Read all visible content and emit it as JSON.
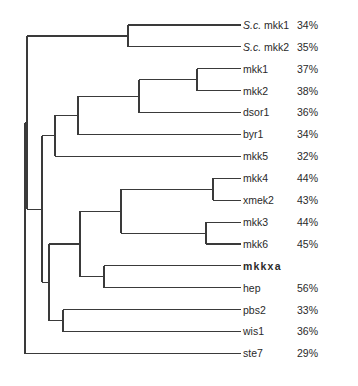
{
  "figure": {
    "type": "phylogenetic-tree",
    "leaves": [
      {
        "id": "scmkk1",
        "species_prefix": "S.c.",
        "name": "mkk1",
        "identity": "34%"
      },
      {
        "id": "scmkk2",
        "species_prefix": "S.c.",
        "name": "mkk2",
        "identity": "35%"
      },
      {
        "id": "mkk1",
        "species_prefix": "",
        "name": "mkk1",
        "identity": "37%"
      },
      {
        "id": "mkk2",
        "species_prefix": "",
        "name": "mkk2",
        "identity": "38%"
      },
      {
        "id": "dsor1",
        "species_prefix": "",
        "name": "dsor1",
        "identity": "36%"
      },
      {
        "id": "byr1",
        "species_prefix": "",
        "name": "byr1",
        "identity": "34%"
      },
      {
        "id": "mkk5",
        "species_prefix": "",
        "name": "mkk5",
        "identity": "32%"
      },
      {
        "id": "mkk4",
        "species_prefix": "",
        "name": "mkk4",
        "identity": "44%"
      },
      {
        "id": "xmek2",
        "species_prefix": "",
        "name": "xmek2",
        "identity": "43%"
      },
      {
        "id": "mkk3",
        "species_prefix": "",
        "name": "mkk3",
        "identity": "44%"
      },
      {
        "id": "mkk6",
        "species_prefix": "",
        "name": "mkk6",
        "identity": "45%"
      },
      {
        "id": "mkkxa",
        "species_prefix": "",
        "name": "mkkxa",
        "identity": "",
        "highlight": true
      },
      {
        "id": "hep",
        "species_prefix": "",
        "name": "hep",
        "identity": "56%"
      },
      {
        "id": "pbs2",
        "species_prefix": "",
        "name": "pbs2",
        "identity": "33%"
      },
      {
        "id": "wis1",
        "species_prefix": "",
        "name": "wis1",
        "identity": "36%"
      },
      {
        "id": "ste7",
        "species_prefix": "",
        "name": "ste7",
        "identity": "29%"
      }
    ],
    "topology": "(((((S.c. mkk1,S.c. mkk2),((((mkk1,mkk2),dsor1),byr1),mkk5),(((mkk4,xmek2),(mkk3,mkk6)),(mkkxa,hep)),(pbs2,wis1))),ste7)",
    "tree": {
      "children": [
        {
          "children": [
            {
              "children": [
                {
                  "leaf": "scmkk1"
                },
                {
                  "leaf": "scmkk2"
                }
              ]
            },
            {
              "children": [
                {
                  "children": [
                    {
                      "children": [
                        {
                          "children": [
                            {
                              "children": [
                                {
                                  "leaf": "mkk1"
                                },
                                {
                                  "leaf": "mkk2"
                                }
                              ]
                            },
                            {
                              "leaf": "dsor1"
                            }
                          ]
                        },
                        {
                          "leaf": "byr1"
                        }
                      ]
                    },
                    {
                      "leaf": "mkk5"
                    }
                  ]
                },
                {
                  "children": [
                    {
                      "children": [
                        {
                          "children": [
                            {
                              "children": [
                                {
                                  "leaf": "mkk4"
                                },
                                {
                                  "leaf": "xmek2"
                                }
                              ]
                            },
                            {
                              "children": [
                                {
                                  "leaf": "mkk3"
                                },
                                {
                                  "leaf": "mkk6"
                                }
                              ]
                            }
                          ]
                        },
                        {
                          "children": [
                            {
                              "leaf": "mkkxa"
                            },
                            {
                              "leaf": "hep"
                            }
                          ]
                        }
                      ]
                    },
                    {
                      "children": [
                        {
                          "leaf": "pbs2"
                        },
                        {
                          "leaf": "wis1"
                        }
                      ]
                    }
                  ]
                }
              ]
            }
          ]
        },
        {
          "leaf": "ste7"
        }
      ]
    }
  }
}
